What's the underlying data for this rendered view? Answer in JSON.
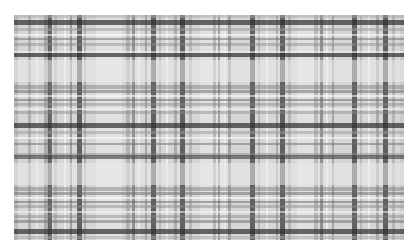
{
  "image": {
    "description": "Grayscale tartan plaid pattern",
    "background": "#ffffff",
    "fabric": {
      "x": 14,
      "y": 15,
      "width": 390,
      "height": 225,
      "base_color": "#d6d6d6"
    },
    "vertical_stripes": [
      {
        "x": 0,
        "w": 4,
        "color": "#a8a8a8",
        "a": 0.55
      },
      {
        "x": 14,
        "w": 3,
        "color": "#8c8c8c",
        "a": 0.5
      },
      {
        "x": 22,
        "w": 2,
        "color": "#f2f2f2",
        "a": 0.6
      },
      {
        "x": 30,
        "w": 5,
        "color": "#777777",
        "a": 0.45
      },
      {
        "x": 34,
        "w": 4,
        "color": "#3a3a3a",
        "a": 0.7
      },
      {
        "x": 40,
        "w": 3,
        "color": "#9a9a9a",
        "a": 0.5
      },
      {
        "x": 50,
        "w": 2,
        "color": "#ffffff",
        "a": 0.55
      },
      {
        "x": 56,
        "w": 2,
        "color": "#666666",
        "a": 0.5
      },
      {
        "x": 63,
        "w": 5,
        "color": "#2e2e2e",
        "a": 0.7
      },
      {
        "x": 70,
        "w": 2,
        "color": "#888888",
        "a": 0.5
      },
      {
        "x": 82,
        "w": 26,
        "color": "#ececec",
        "a": 0.55
      },
      {
        "x": 112,
        "w": 4,
        "color": "#8a8a8a",
        "a": 0.45
      },
      {
        "x": 118,
        "w": 3,
        "color": "#5a5a5a",
        "a": 0.55
      },
      {
        "x": 124,
        "w": 2,
        "color": "#f5f5f5",
        "a": 0.6
      },
      {
        "x": 131,
        "w": 2,
        "color": "#777777",
        "a": 0.5
      },
      {
        "x": 137,
        "w": 5,
        "color": "#2f2f2f",
        "a": 0.7
      },
      {
        "x": 145,
        "w": 2,
        "color": "#9a9a9a",
        "a": 0.5
      },
      {
        "x": 152,
        "w": 2,
        "color": "#ffffff",
        "a": 0.5
      },
      {
        "x": 160,
        "w": 3,
        "color": "#7a7a7a",
        "a": 0.45
      },
      {
        "x": 166,
        "w": 5,
        "color": "#2e2e2e",
        "a": 0.7
      },
      {
        "x": 175,
        "w": 3,
        "color": "#999999",
        "a": 0.5
      },
      {
        "x": 186,
        "w": 24,
        "color": "#ebebeb",
        "a": 0.55
      },
      {
        "x": 199,
        "w": 3,
        "color": "#8a8a8a",
        "a": 0.45
      },
      {
        "x": 204,
        "w": 2,
        "color": "#666666",
        "a": 0.5
      },
      {
        "x": 210,
        "w": 2,
        "color": "#f5f5f5",
        "a": 0.6
      },
      {
        "x": 214,
        "w": 3,
        "color": "#6c6c6c",
        "a": 0.5
      },
      {
        "x": 236,
        "w": 5,
        "color": "#2e2e2e",
        "a": 0.7
      },
      {
        "x": 244,
        "w": 2,
        "color": "#999999",
        "a": 0.5
      },
      {
        "x": 252,
        "w": 2,
        "color": "#ffffff",
        "a": 0.5
      },
      {
        "x": 262,
        "w": 2,
        "color": "#7a7a7a",
        "a": 0.45
      },
      {
        "x": 266,
        "w": 5,
        "color": "#2e2e2e",
        "a": 0.7
      },
      {
        "x": 274,
        "w": 3,
        "color": "#999999",
        "a": 0.5
      },
      {
        "x": 283,
        "w": 22,
        "color": "#ebebeb",
        "a": 0.55
      },
      {
        "x": 300,
        "w": 4,
        "color": "#8a8a8a",
        "a": 0.45
      },
      {
        "x": 306,
        "w": 3,
        "color": "#5a5a5a",
        "a": 0.55
      },
      {
        "x": 312,
        "w": 2,
        "color": "#f5f5f5",
        "a": 0.6
      },
      {
        "x": 318,
        "w": 2,
        "color": "#777777",
        "a": 0.5
      },
      {
        "x": 338,
        "w": 5,
        "color": "#2e2e2e",
        "a": 0.7
      },
      {
        "x": 346,
        "w": 2,
        "color": "#999999",
        "a": 0.5
      },
      {
        "x": 354,
        "w": 2,
        "color": "#ffffff",
        "a": 0.5
      },
      {
        "x": 362,
        "w": 3,
        "color": "#7a7a7a",
        "a": 0.45
      },
      {
        "x": 369,
        "w": 5,
        "color": "#2e2e2e",
        "a": 0.7
      },
      {
        "x": 378,
        "w": 3,
        "color": "#999999",
        "a": 0.5
      },
      {
        "x": 386,
        "w": 4,
        "color": "#bdbdbd",
        "a": 0.5
      }
    ],
    "horizontal_stripes": [
      {
        "y": 0,
        "w": 3,
        "color": "#a8a8a8",
        "a": 0.5
      },
      {
        "y": 5,
        "w": 5,
        "color": "#2e2e2e",
        "a": 0.7
      },
      {
        "y": 13,
        "w": 3,
        "color": "#999999",
        "a": 0.5
      },
      {
        "y": 19,
        "w": 2,
        "color": "#ffffff",
        "a": 0.55
      },
      {
        "y": 23,
        "w": 2,
        "color": "#6c6c6c",
        "a": 0.5
      },
      {
        "y": 28,
        "w": 3,
        "color": "#8a8a8a",
        "a": 0.45
      },
      {
        "y": 36,
        "w": 2,
        "color": "#f5f5f5",
        "a": 0.55
      },
      {
        "y": 38,
        "w": 4,
        "color": "#2e2e2e",
        "a": 0.7
      },
      {
        "y": 45,
        "w": 22,
        "color": "#ebebeb",
        "a": 0.55
      },
      {
        "y": 70,
        "w": 4,
        "color": "#7a7a7a",
        "a": 0.45
      },
      {
        "y": 75,
        "w": 3,
        "color": "#6a6a6a",
        "a": 0.5
      },
      {
        "y": 80,
        "w": 2,
        "color": "#ffffff",
        "a": 0.55
      },
      {
        "y": 84,
        "w": 2,
        "color": "#666666",
        "a": 0.5
      },
      {
        "y": 88,
        "w": 3,
        "color": "#8a8a8a",
        "a": 0.45
      },
      {
        "y": 93,
        "w": 2,
        "color": "#f5f5f5",
        "a": 0.55
      },
      {
        "y": 96,
        "w": 3,
        "color": "#8a8a8a",
        "a": 0.45
      },
      {
        "y": 108,
        "w": 5,
        "color": "#2e2e2e",
        "a": 0.7
      },
      {
        "y": 116,
        "w": 3,
        "color": "#999999",
        "a": 0.5
      },
      {
        "y": 122,
        "w": 2,
        "color": "#ffffff",
        "a": 0.55
      },
      {
        "y": 128,
        "w": 2,
        "color": "#6c6c6c",
        "a": 0.5
      },
      {
        "y": 138,
        "w": 3,
        "color": "#8a8a8a",
        "a": 0.45
      },
      {
        "y": 140,
        "w": 4,
        "color": "#3a3a3a",
        "a": 0.6
      },
      {
        "y": 148,
        "w": 22,
        "color": "#ebebeb",
        "a": 0.55
      },
      {
        "y": 172,
        "w": 4,
        "color": "#7a7a7a",
        "a": 0.45
      },
      {
        "y": 177,
        "w": 3,
        "color": "#6a6a6a",
        "a": 0.5
      },
      {
        "y": 182,
        "w": 2,
        "color": "#ffffff",
        "a": 0.55
      },
      {
        "y": 186,
        "w": 2,
        "color": "#666666",
        "a": 0.5
      },
      {
        "y": 190,
        "w": 3,
        "color": "#8a8a8a",
        "a": 0.45
      },
      {
        "y": 196,
        "w": 2,
        "color": "#f5f5f5",
        "a": 0.55
      },
      {
        "y": 200,
        "w": 3,
        "color": "#8a8a8a",
        "a": 0.45
      },
      {
        "y": 205,
        "w": 3,
        "color": "#6a6a6a",
        "a": 0.5
      },
      {
        "y": 214,
        "w": 5,
        "color": "#2e2e2e",
        "a": 0.7
      },
      {
        "y": 221,
        "w": 3,
        "color": "#a8a8a8",
        "a": 0.5
      }
    ]
  }
}
